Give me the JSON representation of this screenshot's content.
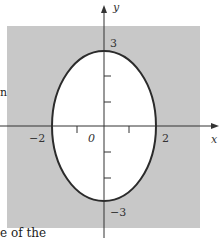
{
  "figure": {
    "type": "ellipse region plot",
    "axes": {
      "x_label": "x",
      "y_label": "y",
      "origin_label": "0",
      "x_tick_labels": {
        "neg": "−2",
        "pos": "2"
      },
      "y_tick_labels": {
        "pos": "3",
        "neg": "−3"
      }
    },
    "ellipse": {
      "semi_axis_x": 2,
      "semi_axis_y": 3,
      "interior": "white",
      "exterior": "shaded"
    },
    "colors": {
      "shade": "#c8c8c8",
      "curve": "#2b2b2b",
      "axis": "#333333",
      "background": "#ffffff"
    }
  },
  "caption_fragment": "e of the",
  "side_fragment": "n"
}
